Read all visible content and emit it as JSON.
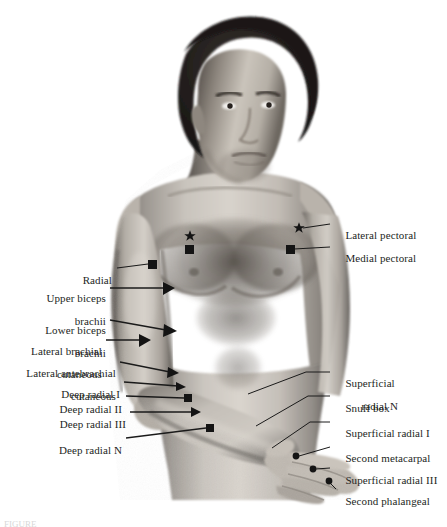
{
  "figure": {
    "background_color": "#ffffff",
    "text_color": "#231f1d",
    "line_color": "#1a1a1a",
    "width": 447,
    "height": 527
  },
  "subject": {
    "description": "Grayscale photograph of a shirtless man, head and torso, right arm extended downward with hand shown",
    "alt": "male-torso-photograph"
  },
  "labels_left": [
    {
      "id": "radial",
      "text": "Radial",
      "lines": [
        "Radial"
      ]
    },
    {
      "id": "upper-biceps-brachii",
      "text": "Upper biceps brachii",
      "lines": [
        "Upper biceps",
        "brachii"
      ]
    },
    {
      "id": "lower-biceps-brachii",
      "text": "Lower biceps brachii",
      "lines": [
        "Lower biceps",
        "brachii"
      ]
    },
    {
      "id": "lateral-brachial-cutaneous",
      "text": "Lateral brachial cutaneous",
      "lines": [
        "Lateral brachial",
        "cutaneous"
      ]
    },
    {
      "id": "lateral-antebrachial-cutaneous",
      "text": "Lateral antebrachial cutaneous",
      "lines": [
        "Lateral antebrachial",
        "cutaneous"
      ]
    },
    {
      "id": "deep-radial-1",
      "text": "Deep radial I",
      "lines": [
        "Deep radial I"
      ]
    },
    {
      "id": "deep-radial-2",
      "text": "Deep radial II",
      "lines": [
        "Deep radial II"
      ]
    },
    {
      "id": "deep-radial-3",
      "text": "Deep radial III",
      "lines": [
        "Deep radial III"
      ]
    },
    {
      "id": "deep-radial-n",
      "text": "Deep radial N",
      "lines": [
        "Deep radial N"
      ]
    }
  ],
  "labels_right": [
    {
      "id": "lateral-pectoral",
      "text": "Lateral pectoral",
      "lines": [
        "Lateral pectoral"
      ]
    },
    {
      "id": "medial-pectoral",
      "text": "Medial pectoral",
      "lines": [
        "Medial pectoral"
      ]
    },
    {
      "id": "superficial-radial-n",
      "text": "Superficial radial N",
      "lines": [
        "Superficial",
        "radial N"
      ]
    },
    {
      "id": "snuff-box",
      "text": "Snuff box",
      "lines": [
        "Snuff box"
      ]
    },
    {
      "id": "superficial-radial-1",
      "text": "Superficial radial I",
      "lines": [
        "Superficial radial I"
      ]
    },
    {
      "id": "second-metacarpal",
      "text": "Second metacarpal",
      "lines": [
        "Second metacarpal"
      ]
    },
    {
      "id": "superficial-radial-3",
      "text": "Superficial radial III",
      "lines": [
        "Superficial radial III"
      ]
    },
    {
      "id": "second-phalangeal",
      "text": "Second phalangeal",
      "lines": [
        "Second phalangeal"
      ]
    }
  ],
  "markers": {
    "star": {
      "name": "star-marker",
      "meaning": "Lateral pectoral point"
    },
    "square": {
      "name": "square-marker",
      "meaning": "Medial pectoral / Radial point"
    },
    "triangle": {
      "name": "triangle-marker",
      "meaning": "Biceps and cutaneous points"
    },
    "dot": {
      "name": "dot-marker",
      "meaning": "Hand surface points"
    }
  },
  "caption": {
    "text": "FIGURE"
  }
}
